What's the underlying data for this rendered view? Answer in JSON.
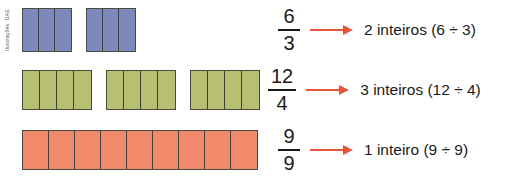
{
  "credit": {
    "text": "Ilustrações: DAE"
  },
  "colors": {
    "blue": "#7d88bb",
    "green": "#b7bf70",
    "orange": "#f08a6a",
    "arrow": "#e8553c",
    "outline": "#4a4a42",
    "text": "#1a1a1a",
    "background": "#ffffff"
  },
  "rows": [
    {
      "id": "row-six-thirds",
      "color_name": "blue",
      "color": "#7d88bb",
      "group_count": 2,
      "parts_per_group": 3,
      "total_parts": 6,
      "part_width": 16,
      "part_height": 44,
      "group_gap": 14,
      "expr_left": 278,
      "fraction": {
        "numerator": "6",
        "denominator": "3"
      },
      "result": "2 inteiros (6 ÷ 3)"
    },
    {
      "id": "row-twelve-fourths",
      "color_name": "green",
      "color": "#b7bf70",
      "group_count": 3,
      "parts_per_group": 4,
      "total_parts": 12,
      "part_width": 17,
      "part_height": 40,
      "group_gap": 14,
      "expr_left": 268,
      "fraction": {
        "numerator": "12",
        "denominator": "4"
      },
      "result": "3 inteiros (12 ÷ 4)"
    },
    {
      "id": "row-nine-ninths",
      "color_name": "orange",
      "color": "#f08a6a",
      "group_count": 1,
      "parts_per_group": 9,
      "total_parts": 9,
      "part_width": 26,
      "part_height": 40,
      "group_gap": 0,
      "expr_left": 278,
      "fraction": {
        "numerator": "9",
        "denominator": "9"
      },
      "result": "1 inteiro (9 ÷ 9)"
    }
  ]
}
